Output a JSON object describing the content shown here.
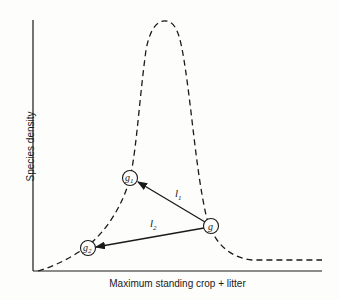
{
  "axes": {
    "x_label": "Maximum standing crop + litter",
    "y_label": "Species density"
  },
  "curve": {
    "style": "dashed",
    "description": "Hump-shaped species density curve peaking at intermediate biomass, with a low plateau at high biomass"
  },
  "nodes": [
    {
      "id": "g",
      "label": "g",
      "subscript": ""
    },
    {
      "id": "g1",
      "label": "g",
      "subscript": "1"
    },
    {
      "id": "g2",
      "label": "g",
      "subscript": "2"
    }
  ],
  "edges": [
    {
      "from": "g",
      "to": "g1",
      "label": "l",
      "subscript": "1"
    },
    {
      "from": "g",
      "to": "g2",
      "label": "l",
      "subscript": "2"
    }
  ],
  "colors": {
    "ink": "#1a1a1a",
    "background": "#fdfdfc"
  }
}
